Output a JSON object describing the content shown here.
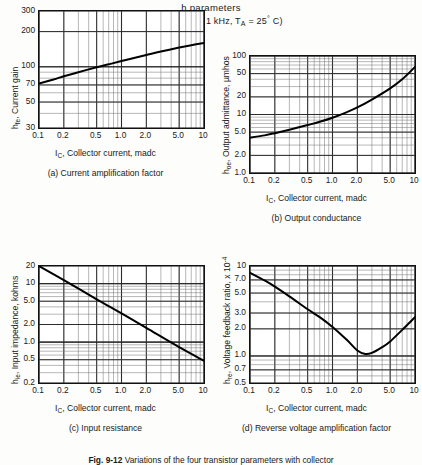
{
  "header": {
    "title": "h parameters",
    "conditions_prefix": "(V",
    "conditions_sub1": "CE",
    "conditions_mid": " = 10 v, f = 1 kHz, T",
    "conditions_sub2": "A",
    "conditions_end": " = 25",
    "conditions_deg": "°",
    "conditions_tail": " C)"
  },
  "figure_caption": {
    "label": "Fig. 9-12",
    "text": "Variations of the four transistor parameters with collector"
  },
  "common": {
    "xlabel_prefix": "I",
    "xlabel_sub": "C",
    "xlabel_rest": ", Collector current, madc",
    "xticks": [
      "0.1",
      "0.2",
      "0.5",
      "1.0",
      "2.0",
      "5.0",
      "10"
    ]
  },
  "chart_data": [
    {
      "id": "a",
      "type": "line",
      "caption": "(a) Current amplification factor",
      "title": "",
      "ylabel_prefix": "h",
      "ylabel_sub": "fe",
      "ylabel_rest": ", Current gain",
      "xlabel": "I_C, Collector current, madc",
      "xscale": "log",
      "yscale": "log",
      "xlim": [
        0.1,
        10
      ],
      "ylim": [
        30,
        300
      ],
      "yticks": [
        "300",
        "200",
        "100",
        "70",
        "50",
        "30"
      ],
      "ytick_values": [
        300,
        200,
        100,
        70,
        50,
        30
      ],
      "xticks": [
        "0.1",
        "0.2",
        "0.5",
        "1.0",
        "2.0",
        "5.0",
        "10"
      ],
      "xtick_values": [
        0.1,
        0.2,
        0.5,
        1.0,
        2.0,
        5.0,
        10
      ],
      "grid": true,
      "legend": "none",
      "x": [
        0.1,
        0.15,
        0.2,
        0.3,
        0.5,
        0.7,
        1.0,
        1.5,
        2.0,
        3.0,
        5.0,
        7.0,
        10
      ],
      "y": [
        72,
        78,
        83,
        90,
        99,
        105,
        112,
        120,
        126,
        135,
        146,
        153,
        160
      ]
    },
    {
      "id": "b",
      "type": "line",
      "caption": "(b) Output conductance",
      "title": "",
      "ylabel_prefix": "h",
      "ylabel_sub": "oe",
      "ylabel_rest": ", Output admittance, µmhos",
      "xlabel": "I_C, Collector current, madc",
      "xscale": "log",
      "yscale": "log",
      "xlim": [
        0.1,
        10
      ],
      "ylim": [
        1.0,
        100
      ],
      "yticks": [
        "100",
        "50",
        "20",
        "10",
        "5.0",
        "2.0",
        "1.0"
      ],
      "ytick_values": [
        100,
        50,
        20,
        10,
        5.0,
        2.0,
        1.0
      ],
      "xticks": [
        "0.1",
        "0.2",
        "0.5",
        "1.0",
        "2.0",
        "5.0",
        "10"
      ],
      "xtick_values": [
        0.1,
        0.2,
        0.5,
        1.0,
        2.0,
        5.0,
        10
      ],
      "grid": true,
      "legend": "none",
      "x": [
        0.1,
        0.15,
        0.2,
        0.3,
        0.5,
        0.7,
        1.0,
        1.5,
        2.0,
        3.0,
        5.0,
        7.0,
        10
      ],
      "y": [
        4.0,
        4.4,
        4.8,
        5.5,
        6.6,
        7.5,
        8.8,
        11.0,
        13.2,
        18.0,
        28.0,
        40.0,
        65.0
      ]
    },
    {
      "id": "c",
      "type": "line",
      "caption": "(c) Input resistance",
      "title": "",
      "ylabel_prefix": "h",
      "ylabel_sub": "ie",
      "ylabel_rest": ", Input impedance, kohms",
      "xlabel": "I_C, Collector current, madc",
      "xscale": "log",
      "yscale": "log",
      "xlim": [
        0.1,
        10
      ],
      "ylim": [
        0.2,
        20
      ],
      "yticks": [
        "20",
        "10",
        "5.0",
        "2.0",
        "1.0",
        "0.5",
        "0.2"
      ],
      "ytick_values": [
        20,
        10,
        5.0,
        2.0,
        1.0,
        0.5,
        0.2
      ],
      "xticks": [
        "0.1",
        "0.2",
        "0.5",
        "1.0",
        "2.0",
        "5.0",
        "10"
      ],
      "xtick_values": [
        0.1,
        0.2,
        0.5,
        1.0,
        2.0,
        5.0,
        10
      ],
      "grid": true,
      "legend": "none",
      "x": [
        0.1,
        0.2,
        0.5,
        1.0,
        2.0,
        5.0,
        10
      ],
      "y": [
        20.0,
        11.5,
        5.4,
        3.1,
        1.75,
        0.82,
        0.48
      ]
    },
    {
      "id": "d",
      "type": "line",
      "caption": "(d) Reverse voltage amplification factor",
      "title": "",
      "ylabel_prefix": "h",
      "ylabel_sub": "re",
      "ylabel_rest": ", Voltage feedback ratio, x 10",
      "ylabel_exp": "-4",
      "xlabel": "I_C, Collector current, madc",
      "xscale": "log",
      "yscale": "log",
      "xlim": [
        0.1,
        10
      ],
      "ylim": [
        0.5,
        10
      ],
      "yticks": [
        "10",
        "7.0",
        "5.0",
        "3.0",
        "2.0",
        "1.0",
        "0.7",
        "0.5"
      ],
      "ytick_values": [
        10,
        7.0,
        5.0,
        3.0,
        2.0,
        1.0,
        0.7,
        0.5
      ],
      "xticks": [
        "0.1",
        "0.2",
        "0.5",
        "1.0",
        "2.0",
        "5.0",
        "10"
      ],
      "xtick_values": [
        0.1,
        0.2,
        0.5,
        1.0,
        2.0,
        5.0,
        10
      ],
      "grid": true,
      "legend": "none",
      "x": [
        0.1,
        0.15,
        0.2,
        0.3,
        0.5,
        0.7,
        1.0,
        1.5,
        2.0,
        2.5,
        3.0,
        4.0,
        5.0,
        7.0,
        10
      ],
      "y": [
        8.4,
        6.9,
        5.9,
        4.6,
        3.3,
        2.7,
        2.1,
        1.5,
        1.15,
        1.05,
        1.08,
        1.25,
        1.45,
        1.95,
        2.7
      ]
    }
  ]
}
